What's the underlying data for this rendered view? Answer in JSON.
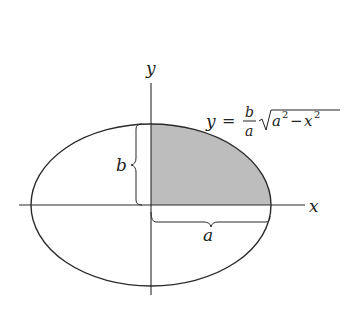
{
  "figure": {
    "type": "ellipse-quarter-area",
    "axes": {
      "x_label": "x",
      "y_label": "y"
    },
    "labels": {
      "semi_minor": "b",
      "semi_major": "a",
      "equation": {
        "lhs": "y",
        "equals": "=",
        "frac_num": "b",
        "frac_den": "a",
        "radicand_a": "a",
        "radicand_a_exp": "2",
        "minus": "−",
        "radicand_x": "x",
        "radicand_x_exp": "2"
      }
    },
    "colors": {
      "stroke": "#2a2a2a",
      "shade": "#bdbdbd",
      "background": "#ffffff"
    },
    "shaded_region": "first quadrant of ellipse"
  }
}
